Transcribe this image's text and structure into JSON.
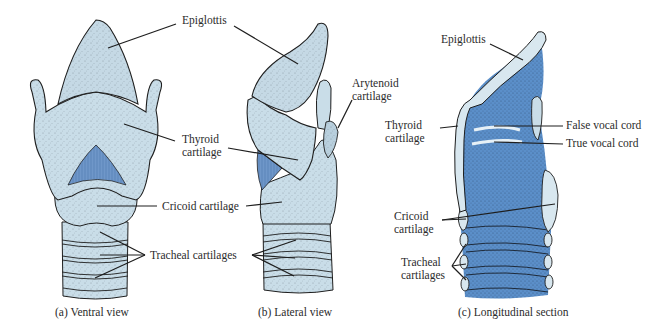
{
  "colors": {
    "cartilage": "#c9dde8",
    "cartilage_light": "#d8e7ef",
    "interior_blue": "#5b8fc9",
    "muscle_blue": "#6f97c9",
    "outline": "#1e1e1e",
    "text": "#2b2b2b",
    "background": "#ffffff"
  },
  "panels": {
    "ventral": {
      "caption": "(a) Ventral view",
      "labels": {
        "epiglottis": "Epiglottis",
        "thyroid_line1": "Thyroid",
        "thyroid_line2": "cartilage",
        "cricoid": "Cricoid cartilage",
        "tracheal": "Tracheal cartilages"
      }
    },
    "lateral": {
      "caption": "(b) Lateral view",
      "labels": {
        "arytenoid_line1": "Arytenoid",
        "arytenoid_line2": "cartilage"
      }
    },
    "longitudinal": {
      "caption": "(c) Longitudinal section",
      "labels": {
        "epiglottis": "Epiglottis",
        "thyroid_line1": "Thyroid",
        "thyroid_line2": "cartilage",
        "false_vocal_cord": "False vocal cord",
        "true_vocal_cord": "True vocal cord",
        "cricoid_line1": "Cricoid",
        "cricoid_line2": "cartilage",
        "tracheal_line1": "Tracheal",
        "tracheal_line2": "cartilages"
      }
    }
  }
}
